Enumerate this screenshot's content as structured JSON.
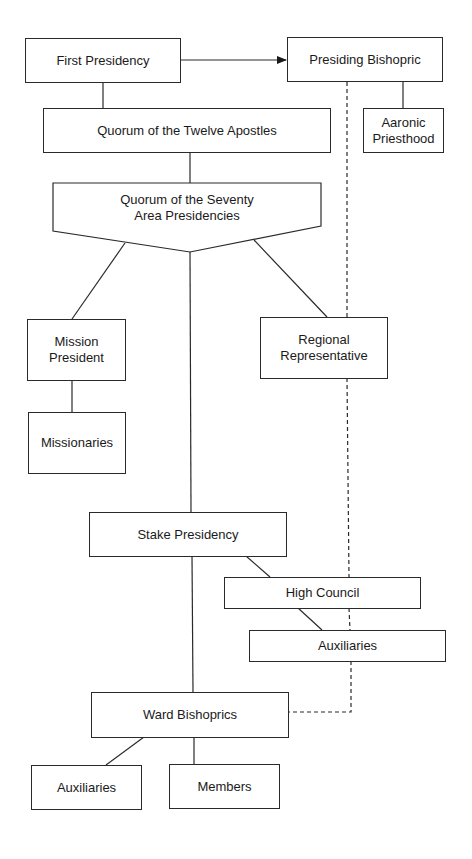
{
  "diagram": {
    "type": "organizational-chart",
    "nodes": {
      "first_presidency": "First Presidency",
      "presiding_bishopric": "Presiding Bishopric",
      "twelve_apostles": "Quorum of the Twelve Apostles",
      "aaronic_priesthood_line1": "Aaronic",
      "aaronic_priesthood_line2": "Priesthood",
      "seventy_line1": "Quorum of the Seventy",
      "seventy_line2": "Area Presidencies",
      "mission_president_line1": "Mission",
      "mission_president_line2": "President",
      "regional_rep_line1": "Regional",
      "regional_rep_line2": "Representative",
      "missionaries": "Missionaries",
      "stake_presidency": "Stake Presidency",
      "high_council": "High Council",
      "stake_auxiliaries": "Auxiliaries",
      "ward_bishoprics": "Ward Bishoprics",
      "ward_auxiliaries": "Auxiliaries",
      "members": "Members"
    },
    "edges": [
      {
        "from": "First Presidency",
        "to": "Presiding Bishopric",
        "style": "arrow"
      },
      {
        "from": "First Presidency",
        "to": "Quorum of the Twelve Apostles",
        "style": "solid"
      },
      {
        "from": "Presiding Bishopric",
        "to": "Aaronic Priesthood",
        "style": "solid"
      },
      {
        "from": "Quorum of the Twelve Apostles",
        "to": "Quorum of the Seventy / Area Presidencies",
        "style": "solid"
      },
      {
        "from": "Quorum of the Seventy / Area Presidencies",
        "to": "Mission President",
        "style": "solid"
      },
      {
        "from": "Quorum of the Seventy / Area Presidencies",
        "to": "Regional Representative",
        "style": "solid"
      },
      {
        "from": "Quorum of the Seventy / Area Presidencies",
        "to": "Stake Presidency",
        "style": "solid"
      },
      {
        "from": "Mission President",
        "to": "Missionaries",
        "style": "solid"
      },
      {
        "from": "Stake Presidency",
        "to": "High Council",
        "style": "solid"
      },
      {
        "from": "High Council",
        "to": "Auxiliaries (stake)",
        "style": "solid"
      },
      {
        "from": "Stake Presidency",
        "to": "Ward Bishoprics",
        "style": "solid"
      },
      {
        "from": "Presiding Bishopric",
        "to": "Ward Bishoprics",
        "style": "dashed"
      },
      {
        "from": "Ward Bishoprics",
        "to": "Auxiliaries (ward)",
        "style": "solid"
      },
      {
        "from": "Ward Bishoprics",
        "to": "Members",
        "style": "solid"
      }
    ],
    "colors": {
      "line": "#2a2a2a",
      "background": "#ffffff"
    }
  }
}
